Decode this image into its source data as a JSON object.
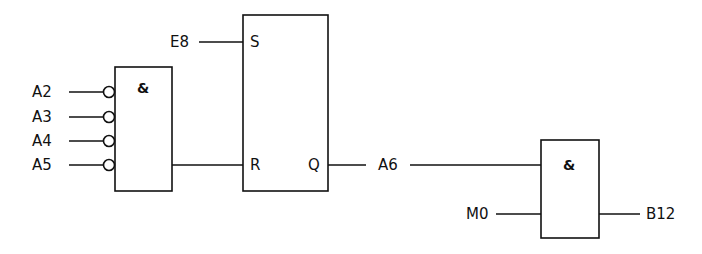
{
  "diagram": {
    "type": "logic-circuit",
    "and_gate_1": {
      "symbol": "&",
      "inputs": [
        {
          "label": "A2",
          "negated": true
        },
        {
          "label": "A3",
          "negated": true
        },
        {
          "label": "A4",
          "negated": true
        },
        {
          "label": "A5",
          "negated": true
        }
      ]
    },
    "sr_flipflop": {
      "set_label": "S",
      "reset_label": "R",
      "output_label": "Q",
      "set_input": "E8",
      "output_signal": "A6"
    },
    "and_gate_2": {
      "symbol": "&",
      "inputs": [
        {
          "label": "A6",
          "negated": false
        },
        {
          "label": "M0",
          "negated": false
        }
      ],
      "output": "B12"
    }
  }
}
